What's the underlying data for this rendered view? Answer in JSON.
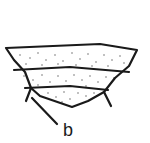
{
  "figure": {
    "type": "cross-section line drawing",
    "bands": [
      {
        "id": "upper",
        "pattern": "stipple"
      },
      {
        "id": "middle",
        "pattern": "stipple"
      },
      {
        "id": "lower",
        "pattern": "stipple"
      }
    ],
    "labels": [
      {
        "id": "b",
        "text": "b"
      }
    ],
    "colors": {
      "line": "#1a1a1a",
      "stipple": "#555555",
      "background": "#ffffff"
    }
  }
}
